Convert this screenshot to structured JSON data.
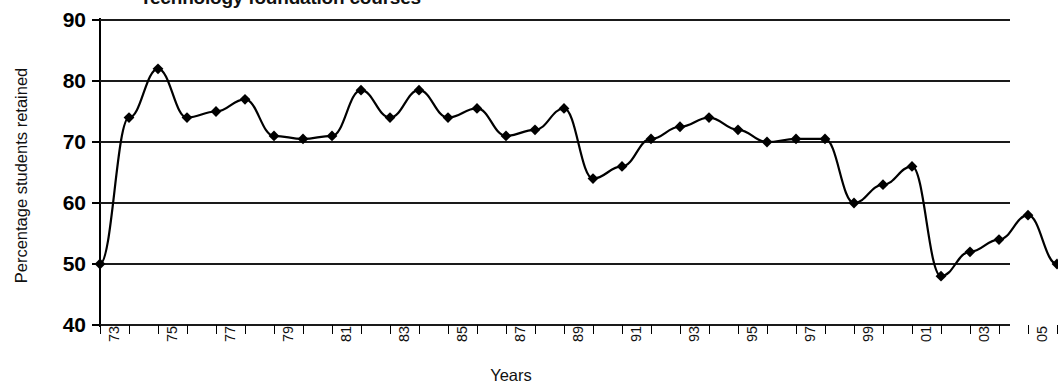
{
  "chart_data": {
    "type": "line",
    "title": "Technology foundation courses",
    "xlabel": "Years",
    "ylabel": "Percentage students retained",
    "ylim": [
      40,
      90
    ],
    "yticks": [
      40,
      50,
      60,
      70,
      80,
      90
    ],
    "grid": true,
    "legend": "none",
    "marker": "diamond",
    "line_color": "#000000",
    "marker_color": "#000000",
    "x": [
      1973,
      1974,
      1975,
      1976,
      1977,
      1978,
      1979,
      1980,
      1981,
      1982,
      1983,
      1984,
      1985,
      1986,
      1987,
      1988,
      1989,
      1990,
      1991,
      1992,
      1993,
      1994,
      1995,
      1996,
      1997,
      1998,
      1999,
      2000,
      2001,
      2002,
      2003
    ],
    "xtick_labels": [
      "73",
      "",
      "75",
      "",
      "77",
      "",
      "79",
      "",
      "81",
      "",
      "83",
      "",
      "85",
      "",
      "87",
      "",
      "89",
      "",
      "91",
      "",
      "93",
      "",
      "95",
      "",
      "97",
      "",
      "99",
      "",
      "01",
      "",
      "03"
    ],
    "values": [
      50,
      74,
      82,
      74,
      75,
      77,
      71,
      70.5,
      78.5,
      74,
      78.5,
      74,
      75.5,
      71,
      72,
      75.5,
      64,
      66,
      70.5,
      72.5,
      74,
      72,
      70,
      70.5,
      60,
      63,
      66,
      48,
      52,
      54,
      58
    ],
    "series": [
      {
        "name": "Percentage students retained",
        "points": [
          {
            "year": "73",
            "value": 50
          },
          {
            "year": "74",
            "value": 74
          },
          {
            "year": "75",
            "value": 82
          },
          {
            "year": "76",
            "value": 74
          },
          {
            "year": "77",
            "value": 75
          },
          {
            "year": "78",
            "value": 77
          },
          {
            "year": "79",
            "value": 71
          },
          {
            "year": "80",
            "value": 70.5
          },
          {
            "year": "81",
            "value": 71
          },
          {
            "year": "82",
            "value": 78.5
          },
          {
            "year": "83",
            "value": 74
          },
          {
            "year": "84",
            "value": 78.5
          },
          {
            "year": "85",
            "value": 74
          },
          {
            "year": "86",
            "value": 75.5
          },
          {
            "year": "87",
            "value": 71
          },
          {
            "year": "88",
            "value": 72
          },
          {
            "year": "89",
            "value": 75.5
          },
          {
            "year": "90",
            "value": 64
          },
          {
            "year": "91",
            "value": 66
          },
          {
            "year": "92",
            "value": 70.5
          },
          {
            "year": "93",
            "value": 72.5
          },
          {
            "year": "94",
            "value": 74
          },
          {
            "year": "95",
            "value": 72
          },
          {
            "year": "96",
            "value": 70
          },
          {
            "year": "97",
            "value": 70.5
          },
          {
            "year": "98",
            "value": 70.5
          },
          {
            "year": "99",
            "value": 60
          },
          {
            "year": "00",
            "value": 63
          },
          {
            "year": "01",
            "value": 66
          },
          {
            "year": "02",
            "value": 48
          },
          {
            "year": "03",
            "value": 52
          },
          {
            "year": "04",
            "value": 54
          },
          {
            "year": "05",
            "value": 58
          },
          {
            "year": "06",
            "value": 50
          }
        ]
      }
    ]
  },
  "axis": {
    "y_title": "Percentage students retained",
    "x_title": "Years",
    "y_tick_labels": [
      "90",
      "80",
      "70",
      "60",
      "50",
      "40"
    ]
  },
  "title": {
    "text": "Technology foundation courses"
  }
}
